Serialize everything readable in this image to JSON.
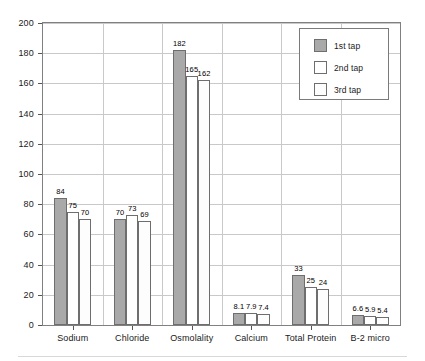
{
  "chart_data": {
    "type": "bar",
    "title": "",
    "xlabel": "",
    "ylabel": "",
    "ylim": [
      0,
      200
    ],
    "ytick_step": 20,
    "yticks": [
      0,
      20,
      40,
      60,
      80,
      100,
      120,
      140,
      160,
      180,
      200
    ],
    "grid": true,
    "legend_position": "top-right",
    "categories": [
      "Sodium",
      "Chloride",
      "Osmolality",
      "Calcium",
      "Total Protein",
      "B-2 micro"
    ],
    "series": [
      {
        "name": "1st tap",
        "color": "#a9a9a9",
        "values": [
          84,
          70,
          182,
          8.1,
          33,
          6.6
        ],
        "labels": [
          "84",
          "70",
          "182",
          "8.1",
          "33",
          "6.6"
        ]
      },
      {
        "name": "2nd tap",
        "color": "#ffffff",
        "values": [
          75,
          73,
          165,
          7.9,
          25,
          5.9
        ],
        "labels": [
          "75",
          "73",
          "165",
          "7.9",
          "25",
          "5.9"
        ]
      },
      {
        "name": "3rd tap",
        "color": "#fdfdfd",
        "values": [
          70,
          69,
          162,
          7.4,
          24,
          5.4
        ],
        "labels": [
          "70",
          "69",
          "162",
          "7.4",
          "24",
          "5.4"
        ]
      }
    ]
  },
  "legend": {
    "items": [
      {
        "label": "1st tap",
        "color": "#a9a9a9"
      },
      {
        "label": "2nd tap",
        "color": "#ffffff"
      },
      {
        "label": "3rd tap",
        "color": "#fdfdfd"
      }
    ]
  },
  "axis": {
    "y_tick_labels": [
      "200",
      "180",
      "160",
      "140",
      "120",
      "100",
      "80",
      "60",
      "40",
      "20",
      "0"
    ]
  }
}
